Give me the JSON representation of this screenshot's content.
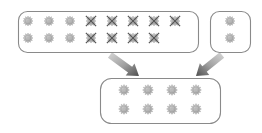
{
  "diagram": {
    "type": "selection-flow",
    "background_color": "#ffffff",
    "box_stroke_color": "#8a8a8a",
    "box_fill_color": "#ffffff",
    "gear_fill_color": "#b5b5b5",
    "gear_stroke_color": "#9a9a9a",
    "cross_color": "#555555",
    "arrow_color": "#6e6e6e",
    "icon_name": "gear-icon",
    "crossed_icon_name": "gear-crossed-out-icon"
  },
  "boxes": [
    {
      "id": "source-pool",
      "label": "Source pool",
      "x": 18,
      "y": 11,
      "width": 180,
      "height": 41,
      "radius": 9,
      "columns": 8,
      "rows": 2,
      "cell_width": 21,
      "cell_height": 17,
      "start_x": 28,
      "start_y": 21,
      "items": [
        {
          "state": "normal"
        },
        {
          "state": "normal"
        },
        {
          "state": "normal"
        },
        {
          "state": "crossed"
        },
        {
          "state": "crossed"
        },
        {
          "state": "crossed"
        },
        {
          "state": "crossed"
        },
        {
          "state": "crossed"
        },
        {
          "state": "normal"
        },
        {
          "state": "normal"
        },
        {
          "state": "normal"
        },
        {
          "state": "crossed"
        },
        {
          "state": "crossed"
        },
        {
          "state": "crossed"
        },
        {
          "state": "crossed"
        },
        {
          "state": "empty"
        }
      ],
      "counts": {
        "total_slots": 16,
        "normal": 6,
        "crossed": 9,
        "empty": 1
      }
    },
    {
      "id": "extra-pool",
      "label": "Extra pool",
      "x": 210,
      "y": 11,
      "width": 40,
      "height": 41,
      "radius": 9,
      "columns": 1,
      "rows": 2,
      "cell_width": 21,
      "cell_height": 17,
      "start_x": 230,
      "start_y": 21,
      "items": [
        {
          "state": "normal"
        },
        {
          "state": "normal"
        }
      ],
      "counts": {
        "total_slots": 2,
        "normal": 2,
        "crossed": 0,
        "empty": 0
      }
    },
    {
      "id": "result-pool",
      "label": "Result pool",
      "x": 100,
      "y": 78,
      "width": 120,
      "height": 45,
      "radius": 11,
      "columns": 4,
      "rows": 2,
      "cell_width": 24,
      "cell_height": 19,
      "start_x": 124,
      "start_y": 90,
      "items": [
        {
          "state": "normal"
        },
        {
          "state": "normal"
        },
        {
          "state": "normal"
        },
        {
          "state": "normal"
        },
        {
          "state": "normal"
        },
        {
          "state": "normal"
        },
        {
          "state": "normal"
        },
        {
          "state": "normal"
        }
      ],
      "counts": {
        "total_slots": 8,
        "normal": 8,
        "crossed": 0,
        "empty": 0
      }
    }
  ],
  "arrows": [
    {
      "id": "arrow-source-to-result",
      "label": "from source pool to result pool",
      "from_box": "source-pool",
      "to_box": "result-pool",
      "x1": 110,
      "y1": 55,
      "x2": 139,
      "y2": 76,
      "tail_width": 7,
      "head_width": 15,
      "head_length": 11
    },
    {
      "id": "arrow-extra-to-result",
      "label": "from extra pool to result pool",
      "from_box": "extra-pool",
      "to_box": "result-pool",
      "x1": 222,
      "y1": 55,
      "x2": 196,
      "y2": 76,
      "tail_width": 7,
      "head_width": 15,
      "head_length": 11
    }
  ]
}
